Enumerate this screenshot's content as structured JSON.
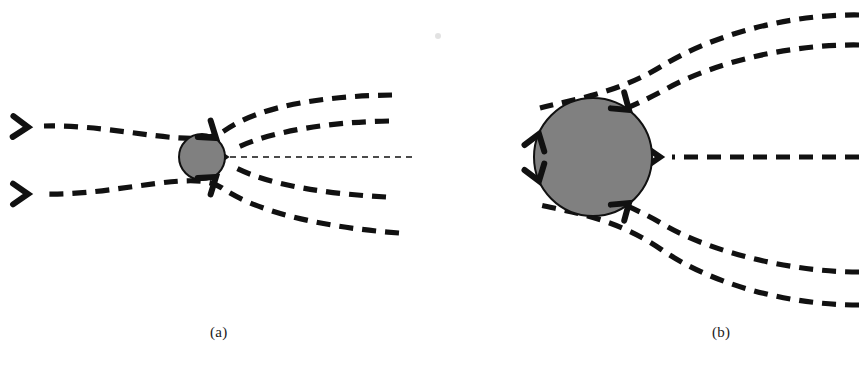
{
  "figure": {
    "background_color": "#ffffff",
    "stroke_color": "#111111",
    "body_fill_color": "#808080",
    "body_edge_color": "#111111",
    "faint_artifact_color": "#d8d8d8",
    "panels": [
      {
        "id": "a",
        "caption": "(a)",
        "caption_x": 210,
        "caption_y": 324,
        "body": {
          "name": "accreting-body-small",
          "cx": 202,
          "cy": 157,
          "r": 23
        },
        "axial_arrow": {
          "name": "axial-inflow-arrow",
          "from_x": 412,
          "to_x": 230,
          "y": 157,
          "dash": "6 5",
          "width": 1.6
        },
        "streamlines": [
          {
            "name": "streamline-outer-top",
            "d": "M 392 95 C 330 96 262 104 224 131 C 196 151 120 124 44 126",
            "arrow_at": [
              28,
              127
            ],
            "arrow_angle": 182
          },
          {
            "name": "streamline-inner-top",
            "d": "M 389 121 C 330 122 272 131 236 148",
            "arrow_at": null,
            "arrow_angle": 0
          },
          {
            "name": "streamline-inner-bottom",
            "d": "M 386 197 C 330 194 272 186 236 168",
            "arrow_at": null,
            "arrow_angle": 0
          },
          {
            "name": "streamline-outer-bottom",
            "d": "M 399 233 C 330 228 260 214 222 188 C 194 168 118 196 44 194",
            "arrow_at": [
              28,
              194
            ],
            "arrow_angle": 180
          }
        ],
        "body_arrowheads": [
          {
            "name": "surface-arrowhead-upper-right",
            "x": 216,
            "y": 138,
            "angle": 218
          },
          {
            "name": "surface-arrowhead-lower-right",
            "x": 216,
            "y": 177,
            "angle": 142
          }
        ]
      },
      {
        "id": "b",
        "caption": "(b)",
        "caption_x": 712,
        "caption_y": 324,
        "body": {
          "name": "accreting-body-large",
          "cx": 593,
          "cy": 157,
          "r": 59
        },
        "axial_arrow": null,
        "streamlines": [
          {
            "name": "streamline-outer-top",
            "d": "M 859 15 C 790 14 714 34 662 66 C 616 94 570 100 540 108",
            "arrow_at": null,
            "arrow_angle": 0
          },
          {
            "name": "streamline-inner-top",
            "d": "M 859 45 C 790 44 716 62 668 88 C 648 99 632 106 620 111",
            "arrow_at": null,
            "arrow_angle": 0
          },
          {
            "name": "streamline-midplane",
            "d": "M 859 157 L 672 157",
            "arrow_at": [
              660,
              157
            ],
            "arrow_angle": 180
          },
          {
            "name": "streamline-inner-bottom",
            "d": "M 859 272 C 790 272 712 252 666 226 C 648 215 632 208 620 203",
            "arrow_at": null,
            "arrow_angle": 0
          },
          {
            "name": "streamline-outer-bottom",
            "d": "M 859 305 C 786 305 712 284 662 250 C 616 218 570 212 540 205",
            "arrow_at": null,
            "arrow_angle": 0
          }
        ],
        "body_arrowheads": [
          {
            "name": "surface-arrowhead-upper-right",
            "x": 629,
            "y": 110,
            "angle": 220
          },
          {
            "name": "surface-arrowhead-lower-right",
            "x": 629,
            "y": 203,
            "angle": 140
          },
          {
            "name": "surface-arrowhead-left-upper",
            "x": 539,
            "y": 134,
            "angle": 108
          },
          {
            "name": "surface-arrowhead-left-lower",
            "x": 539,
            "y": 181,
            "angle": 252
          }
        ]
      }
    ],
    "artifacts": [
      {
        "name": "scan-speck",
        "x": 438,
        "y": 36,
        "r": 3
      }
    ]
  }
}
